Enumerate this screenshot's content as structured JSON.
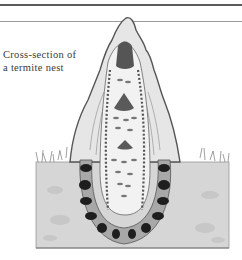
{
  "figure": {
    "caption_line1": "Cross-section of",
    "caption_line2": "a termite nest"
  },
  "colors": {
    "rule": "#5a5a5a",
    "caption_text": "#3a3a3a",
    "soil": "#d8d8d8",
    "mound_outline": "#555555",
    "chamber_dark": "#1e1e1e"
  }
}
